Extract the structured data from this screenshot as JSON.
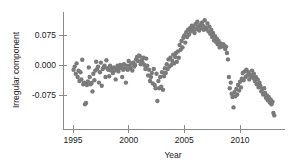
{
  "chart_data": {
    "type": "scatter",
    "title": "",
    "xlabel": "Year",
    "ylabel": "Irregular component",
    "xlim": [
      1994.4,
      2013.4
    ],
    "ylim": [
      -0.135,
      0.125
    ],
    "xticks": [
      1995,
      2000,
      2005,
      2010
    ],
    "xticklabels": [
      "1995",
      "2000",
      "2005",
      "2010"
    ],
    "yticks": [
      -0.075,
      0.0,
      0.075
    ],
    "yticklabels": [
      "-0.075",
      "0.000",
      "0.075"
    ],
    "grid": false,
    "legend": null,
    "marker_color": "#7a7a7a",
    "marker_size": 2.2,
    "axis_color": "#8a8a8a",
    "points": [
      [
        1995.05,
        -0.012
      ],
      [
        1995.15,
        -0.004
      ],
      [
        1995.25,
        -0.022
      ],
      [
        1995.32,
        0.004
      ],
      [
        1995.42,
        -0.03
      ],
      [
        1995.5,
        -0.014
      ],
      [
        1995.58,
        -0.04
      ],
      [
        1995.67,
        -0.018
      ],
      [
        1995.75,
        -0.036
      ],
      [
        1995.83,
        0.013
      ],
      [
        1995.92,
        -0.048
      ],
      [
        1996.0,
        -0.044
      ],
      [
        1996.08,
        -0.098
      ],
      [
        1996.17,
        -0.095
      ],
      [
        1996.25,
        -0.05
      ],
      [
        1996.33,
        -0.041
      ],
      [
        1996.42,
        -0.006
      ],
      [
        1996.5,
        -0.03
      ],
      [
        1996.58,
        -0.048
      ],
      [
        1996.67,
        -0.045
      ],
      [
        1996.75,
        -0.066
      ],
      [
        1996.83,
        -0.022
      ],
      [
        1996.92,
        -0.038
      ],
      [
        1997.0,
        -0.014
      ],
      [
        1997.08,
        0.008
      ],
      [
        1997.17,
        -0.01
      ],
      [
        1997.25,
        -0.004
      ],
      [
        1997.33,
        -0.044
      ],
      [
        1997.42,
        -0.018
      ],
      [
        1997.5,
        0.006
      ],
      [
        1997.58,
        -0.052
      ],
      [
        1997.67,
        -0.01
      ],
      [
        1997.75,
        -0.006
      ],
      [
        1997.83,
        -0.002
      ],
      [
        1997.92,
        -0.03
      ],
      [
        1998.0,
        0.012
      ],
      [
        1998.08,
        -0.008
      ],
      [
        1998.17,
        -0.012
      ],
      [
        1998.25,
        -0.028
      ],
      [
        1998.33,
        -0.002
      ],
      [
        1998.42,
        -0.014
      ],
      [
        1998.5,
        -0.008
      ],
      [
        1998.58,
        -0.02
      ],
      [
        1998.67,
        -0.006
      ],
      [
        1998.75,
        -0.014
      ],
      [
        1998.83,
        -0.036
      ],
      [
        1998.92,
        -0.01
      ],
      [
        1999.0,
        -0.002
      ],
      [
        1999.08,
        -0.016
      ],
      [
        1999.17,
        -0.008
      ],
      [
        1999.25,
        0.0
      ],
      [
        1999.33,
        -0.004
      ],
      [
        1999.42,
        -0.03
      ],
      [
        1999.5,
        -0.012
      ],
      [
        1999.58,
        0.002
      ],
      [
        1999.67,
        -0.008
      ],
      [
        1999.75,
        -0.044
      ],
      [
        1999.83,
        -0.002
      ],
      [
        1999.92,
        -0.012
      ],
      [
        2000.0,
        0.01
      ],
      [
        2000.08,
        -0.002
      ],
      [
        2000.17,
        -0.008
      ],
      [
        2000.25,
        0.004
      ],
      [
        2000.33,
        -0.014
      ],
      [
        2000.42,
        0.006
      ],
      [
        2000.5,
        -0.004
      ],
      [
        2000.58,
        0.0
      ],
      [
        2000.67,
        0.014
      ],
      [
        2000.75,
        0.02
      ],
      [
        2000.83,
        0.01
      ],
      [
        2000.92,
        0.024
      ],
      [
        2001.0,
        0.022
      ],
      [
        2001.08,
        0.002
      ],
      [
        2001.17,
        0.012
      ],
      [
        2001.25,
        0.006
      ],
      [
        2001.33,
        0.018
      ],
      [
        2001.42,
        0.0
      ],
      [
        2001.5,
        -0.01
      ],
      [
        2001.58,
        0.016
      ],
      [
        2001.67,
        -0.002
      ],
      [
        2001.75,
        -0.026
      ],
      [
        2001.83,
        -0.012
      ],
      [
        2001.92,
        -0.04
      ],
      [
        2002.0,
        -0.03
      ],
      [
        2002.08,
        -0.02
      ],
      [
        2002.17,
        -0.046
      ],
      [
        2002.25,
        -0.01
      ],
      [
        2002.33,
        -0.05
      ],
      [
        2002.42,
        -0.058
      ],
      [
        2002.5,
        -0.022
      ],
      [
        2002.58,
        -0.09
      ],
      [
        2002.67,
        -0.04
      ],
      [
        2002.75,
        -0.058
      ],
      [
        2002.83,
        -0.03
      ],
      [
        2002.92,
        -0.054
      ],
      [
        2003.0,
        -0.018
      ],
      [
        2003.08,
        -0.062
      ],
      [
        2003.17,
        -0.028
      ],
      [
        2003.25,
        -0.008
      ],
      [
        2003.33,
        -0.02
      ],
      [
        2003.42,
        0.002
      ],
      [
        2003.5,
        -0.01
      ],
      [
        2003.58,
        0.014
      ],
      [
        2003.67,
        -0.004
      ],
      [
        2003.75,
        0.018
      ],
      [
        2003.83,
        0.0
      ],
      [
        2003.92,
        0.01
      ],
      [
        2004.0,
        0.026
      ],
      [
        2004.08,
        0.004
      ],
      [
        2004.17,
        0.02
      ],
      [
        2004.25,
        0.03
      ],
      [
        2004.33,
        0.008
      ],
      [
        2004.42,
        0.034
      ],
      [
        2004.5,
        0.018
      ],
      [
        2004.58,
        0.05
      ],
      [
        2004.67,
        0.038
      ],
      [
        2004.75,
        0.06
      ],
      [
        2004.83,
        0.044
      ],
      [
        2004.92,
        0.068
      ],
      [
        2005.0,
        0.074
      ],
      [
        2005.08,
        0.056
      ],
      [
        2005.17,
        0.082
      ],
      [
        2005.25,
        0.07
      ],
      [
        2005.33,
        0.088
      ],
      [
        2005.42,
        0.076
      ],
      [
        2005.5,
        0.092
      ],
      [
        2005.58,
        0.084
      ],
      [
        2005.67,
        0.098
      ],
      [
        2005.75,
        0.086
      ],
      [
        2005.83,
        0.094
      ],
      [
        2005.92,
        0.08
      ],
      [
        2006.0,
        0.102
      ],
      [
        2006.08,
        0.09
      ],
      [
        2006.17,
        0.108
      ],
      [
        2006.25,
        0.096
      ],
      [
        2006.33,
        0.086
      ],
      [
        2006.42,
        0.1
      ],
      [
        2006.5,
        0.092
      ],
      [
        2006.58,
        0.106
      ],
      [
        2006.67,
        0.098
      ],
      [
        2006.75,
        0.088
      ],
      [
        2006.83,
        0.112
      ],
      [
        2006.92,
        0.094
      ],
      [
        2007.0,
        0.09
      ],
      [
        2007.08,
        0.104
      ],
      [
        2007.17,
        0.084
      ],
      [
        2007.25,
        0.096
      ],
      [
        2007.33,
        0.078
      ],
      [
        2007.42,
        0.088
      ],
      [
        2007.5,
        0.07
      ],
      [
        2007.58,
        0.08
      ],
      [
        2007.67,
        0.062
      ],
      [
        2007.75,
        0.072
      ],
      [
        2007.83,
        0.058
      ],
      [
        2007.92,
        0.066
      ],
      [
        2008.0,
        0.052
      ],
      [
        2008.08,
        0.06
      ],
      [
        2008.17,
        0.044
      ],
      [
        2008.25,
        0.054
      ],
      [
        2008.33,
        0.05
      ],
      [
        2008.42,
        0.046
      ],
      [
        2008.5,
        0.052
      ],
      [
        2008.58,
        0.048
      ],
      [
        2008.67,
        0.04
      ],
      [
        2008.75,
        0.046
      ],
      [
        2008.83,
        0.03
      ],
      [
        2008.92,
        0.014
      ],
      [
        2009.0,
        -0.03
      ],
      [
        2009.08,
        -0.058
      ],
      [
        2009.17,
        -0.044
      ],
      [
        2009.25,
        -0.072
      ],
      [
        2009.33,
        -0.08
      ],
      [
        2009.42,
        -0.106
      ],
      [
        2009.5,
        -0.068
      ],
      [
        2009.58,
        -0.078
      ],
      [
        2009.67,
        -0.06
      ],
      [
        2009.75,
        -0.074
      ],
      [
        2009.83,
        -0.05
      ],
      [
        2009.92,
        -0.064
      ],
      [
        2010.0,
        -0.042
      ],
      [
        2010.08,
        -0.056
      ],
      [
        2010.17,
        -0.034
      ],
      [
        2010.25,
        -0.02
      ],
      [
        2010.33,
        -0.038
      ],
      [
        2010.42,
        -0.016
      ],
      [
        2010.5,
        -0.03
      ],
      [
        2010.58,
        -0.012
      ],
      [
        2010.67,
        -0.026
      ],
      [
        2010.75,
        -0.018
      ],
      [
        2010.83,
        -0.036
      ],
      [
        2010.92,
        -0.024
      ],
      [
        2011.0,
        -0.028
      ],
      [
        2011.08,
        -0.014
      ],
      [
        2011.17,
        -0.032
      ],
      [
        2011.25,
        -0.022
      ],
      [
        2011.33,
        -0.04
      ],
      [
        2011.42,
        -0.03
      ],
      [
        2011.5,
        -0.048
      ],
      [
        2011.58,
        -0.036
      ],
      [
        2011.67,
        -0.056
      ],
      [
        2011.75,
        -0.044
      ],
      [
        2011.83,
        -0.052
      ],
      [
        2011.92,
        -0.066
      ],
      [
        2012.0,
        -0.06
      ],
      [
        2012.08,
        -0.074
      ],
      [
        2012.17,
        -0.058
      ],
      [
        2012.25,
        -0.07
      ],
      [
        2012.33,
        -0.082
      ],
      [
        2012.42,
        -0.076
      ],
      [
        2012.5,
        -0.088
      ],
      [
        2012.58,
        -0.08
      ],
      [
        2012.67,
        -0.094
      ],
      [
        2012.75,
        -0.086
      ],
      [
        2012.83,
        -0.098
      ],
      [
        2012.92,
        -0.092
      ],
      [
        2013.0,
        -0.12
      ],
      [
        2013.08,
        -0.126
      ]
    ]
  }
}
